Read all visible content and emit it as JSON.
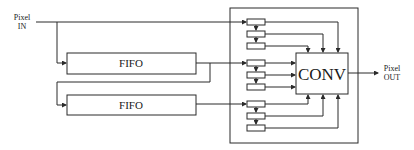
{
  "diagram": {
    "title": "",
    "input_label": {
      "line1": "Pixel",
      "line2": "IN"
    },
    "output_label": {
      "line1": "Pixel",
      "line2": "OUT"
    },
    "blocks": [
      {
        "id": "fifo1",
        "label": "FIFO"
      },
      {
        "id": "fifo2",
        "label": "FIFO"
      },
      {
        "id": "conv",
        "label": "CONV"
      }
    ],
    "register_groups": [
      {
        "id": "group1",
        "registers": 3,
        "source": "Pixel IN"
      },
      {
        "id": "group2",
        "registers": 3,
        "source": "FIFO 1 output"
      },
      {
        "id": "group3",
        "registers": 3,
        "source": "FIFO 2 output"
      }
    ],
    "edges": [
      {
        "from": "Pixel IN",
        "to": "group1.reg1"
      },
      {
        "from": "Pixel IN",
        "to": "fifo1"
      },
      {
        "from": "fifo1",
        "to": "group2.reg1"
      },
      {
        "from": "fifo1",
        "to": "fifo2"
      },
      {
        "from": "fifo2",
        "to": "group3.reg1"
      },
      {
        "from": "group1.reg1",
        "to": "conv"
      },
      {
        "from": "group1.reg2",
        "to": "conv"
      },
      {
        "from": "group1.reg3",
        "to": "conv"
      },
      {
        "from": "group2.reg1",
        "to": "conv"
      },
      {
        "from": "group2.reg2",
        "to": "conv"
      },
      {
        "from": "group2.reg3",
        "to": "conv"
      },
      {
        "from": "group3.reg1",
        "to": "conv"
      },
      {
        "from": "group3.reg2",
        "to": "conv"
      },
      {
        "from": "group3.reg3",
        "to": "conv"
      },
      {
        "from": "conv",
        "to": "Pixel OUT"
      }
    ],
    "colors": {
      "stroke": "#2a2a2a",
      "background": "#ffffff",
      "text": "#1a1a1a"
    }
  }
}
